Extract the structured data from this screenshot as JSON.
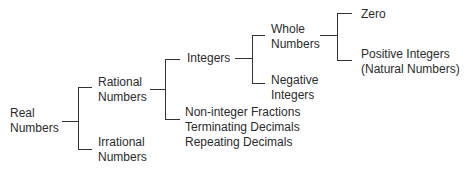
{
  "diagram": {
    "line_color": "#333333",
    "text_color": "#2b2b2b",
    "nodes": {
      "real": {
        "line1": "Real",
        "line2": "Numbers"
      },
      "rational": {
        "line1": "Rational",
        "line2": "Numbers"
      },
      "irrational": {
        "line1": "Irrational",
        "line2": "Numbers"
      },
      "integers": {
        "line1": "Integers"
      },
      "non_integers": {
        "line1": "Non-integer Fractions",
        "line2": "Terminating Decimals",
        "line3": "Repeating Decimals"
      },
      "whole": {
        "line1": "Whole",
        "line2": "Numbers"
      },
      "negative": {
        "line1": "Negative",
        "line2": "Integers"
      },
      "zero": {
        "line1": "Zero"
      },
      "positive": {
        "line1": "Positive Integers",
        "line2": "(Natural Numbers)"
      }
    },
    "edges": [
      {
        "from": "Real Numbers",
        "to": "Rational Numbers"
      },
      {
        "from": "Real Numbers",
        "to": "Irrational Numbers"
      },
      {
        "from": "Rational Numbers",
        "to": "Integers"
      },
      {
        "from": "Rational Numbers",
        "to": "Non-integer Fractions / Terminating Decimals / Repeating Decimals"
      },
      {
        "from": "Integers",
        "to": "Whole Numbers"
      },
      {
        "from": "Integers",
        "to": "Negative Integers"
      },
      {
        "from": "Whole Numbers",
        "to": "Zero"
      },
      {
        "from": "Whole Numbers",
        "to": "Positive Integers (Natural Numbers)"
      }
    ]
  }
}
